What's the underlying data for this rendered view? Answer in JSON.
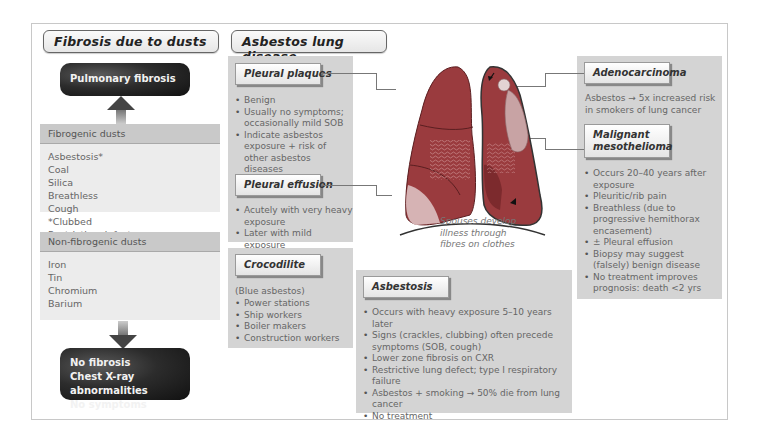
{
  "left_panel": {
    "heading": "Fibrosis due to dusts",
    "fibrosis_box": "Pulmonary fibrosis",
    "fibrogenic": {
      "header": "Fibrogenic dusts",
      "dusts": [
        "Asbestosis*",
        "Coal",
        "Silica"
      ],
      "features": [
        "Breathless",
        "Cough",
        "*Clubbed",
        "Restrictive defect",
        "Type 1 respiratory failure"
      ]
    },
    "non_fibrogenic": {
      "header": "Non-fibrogenic dusts",
      "dusts": [
        "Iron",
        "Tin",
        "Chromium",
        "Barium"
      ]
    },
    "outcome_box": [
      "No fibrosis",
      "Chest X-ray abnormalities",
      "No symptoms"
    ]
  },
  "right_panel": {
    "heading": "Asbestos lung disease",
    "pleural_plaques": {
      "label": "Pleural plaques",
      "items": [
        "Benign",
        "Usually no symptoms; occasionally mild SOB",
        "Indicate asbestos exposure + risk of other asbestos diseases"
      ]
    },
    "pleural_effusion": {
      "label": "Pleural effusion",
      "items": [
        "Acutely with very heavy exposure",
        "Later with mild exposure"
      ]
    },
    "crocodilite": {
      "label": "Crocodilite",
      "intro": "(Blue asbestos)",
      "items": [
        "Power stations",
        "Ship workers",
        "Boiler makers",
        "Construction workers"
      ]
    },
    "asbestosis": {
      "label": "Asbestosis",
      "items": [
        "Occurs with heavy exposure 5–10 years later",
        "Signs (crackles, clubbing) often precede symptoms (SOB, cough)",
        "Lower zone fibrosis on CXR",
        "Restrictive lung defect; type I respiratory failure",
        "Asbestos + smoking → 50% die from lung cancer",
        "No treatment"
      ]
    },
    "adenocarcinoma": {
      "label": "Adenocarcinoma",
      "text": "Asbestos  → 5x increased risk in smokers of lung cancer"
    },
    "mesothelioma": {
      "label_line1": "Malignant",
      "label_line2": "mesothelioma",
      "items": [
        "Occurs 20–40 years after exposure",
        "Pleuritic/rib pain",
        "Breathless (due to progressive hemithorax encasement)",
        "± Pleural effusion",
        "Biopsy may suggest (falsely) benign disease",
        "No treatment improves prognosis: death <2 yrs"
      ]
    },
    "spouse_note": [
      "Spouses develop",
      "illness through",
      "fibres on clothes"
    ]
  },
  "colors": {
    "panel_gray": "#d4d4d4",
    "dust_header": "#c9c9c9",
    "dust_body": "#ececec",
    "lung_red": "#9a3b3e",
    "dark_box": "#1c1c1c"
  }
}
